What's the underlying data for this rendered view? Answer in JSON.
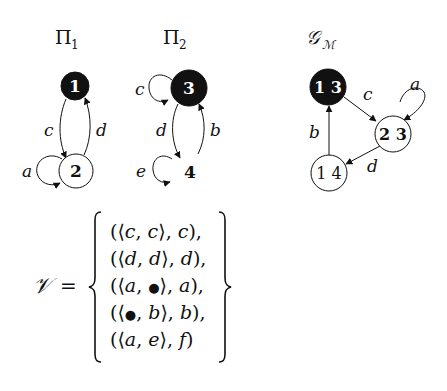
{
  "colors": {
    "ink": "#111111",
    "initial_fill": "#111111",
    "node_fill": "#ffffff",
    "initial_text": "#ffffff",
    "background": "#ffffff"
  },
  "graphs": [
    {
      "id": "pi1",
      "title": "Π",
      "title_sub": "1",
      "nodes": [
        {
          "id": "1",
          "label": "1",
          "initial": true,
          "circled": true
        },
        {
          "id": "2",
          "label": "2",
          "initial": false,
          "circled": true
        }
      ],
      "edges": [
        {
          "from": "1",
          "to": "2",
          "label": "c"
        },
        {
          "from": "2",
          "to": "1",
          "label": "d"
        },
        {
          "from": "2",
          "to": "2",
          "label": "a"
        }
      ]
    },
    {
      "id": "pi2",
      "title": "Π",
      "title_sub": "2",
      "nodes": [
        {
          "id": "3",
          "label": "3",
          "initial": true,
          "circled": true
        },
        {
          "id": "4",
          "label": "4",
          "initial": false,
          "circled": false
        }
      ],
      "edges": [
        {
          "from": "3",
          "to": "3",
          "label": "c"
        },
        {
          "from": "3",
          "to": "4",
          "label": "d"
        },
        {
          "from": "4",
          "to": "3",
          "label": "b"
        },
        {
          "from": "4",
          "to": "4",
          "label": "e"
        }
      ]
    },
    {
      "id": "gm",
      "title": "𝒢",
      "title_sub": "ℳ",
      "nodes": [
        {
          "id": "13",
          "label": "1 3",
          "initial": true,
          "circled": true
        },
        {
          "id": "23",
          "label": "2 3",
          "initial": false,
          "circled": true
        },
        {
          "id": "14",
          "label": "1 4",
          "initial": false,
          "circled": true
        }
      ],
      "edges": [
        {
          "from": "13",
          "to": "23",
          "label": "c"
        },
        {
          "from": "23",
          "to": "23",
          "label": "a"
        },
        {
          "from": "23",
          "to": "14",
          "label": "d"
        },
        {
          "from": "14",
          "to": "13",
          "label": "b"
        }
      ]
    }
  ],
  "equation": {
    "lhs": "𝒱",
    "equals": "=",
    "rows": [
      "((c, c), c),",
      "((d, d), d),",
      "((a, •), a),",
      "((•, b), b),",
      "((a, e), f)"
    ],
    "rows_tex": [
      [
        "(⟨",
        "c",
        ", ",
        "c",
        "⟩, ",
        "c",
        "),"
      ],
      [
        "(⟨",
        "d",
        ", ",
        "d",
        "⟩, ",
        "d",
        "),"
      ],
      [
        "(⟨",
        "a",
        ", ",
        "●",
        "⟩, ",
        "a",
        "),"
      ],
      [
        "(⟨",
        "●",
        ", ",
        "b",
        "⟩, ",
        "b",
        "),"
      ],
      [
        "(⟨",
        "a",
        ", ",
        "e",
        "⟩, ",
        "f",
        ")"
      ]
    ]
  }
}
